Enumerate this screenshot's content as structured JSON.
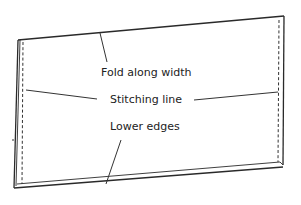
{
  "diagram": {
    "labels": {
      "fold": "Fold along width",
      "stitch": "Stitching line",
      "lower": "Lower edges"
    },
    "colors": {
      "line": "#2a2a2a",
      "text": "#222222",
      "background": "#ffffff"
    }
  }
}
